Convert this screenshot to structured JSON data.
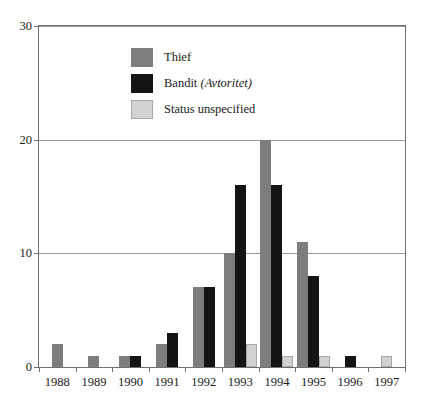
{
  "chart_data": {
    "type": "bar",
    "title": "",
    "xlabel": "",
    "ylabel": "",
    "ylim": [
      0,
      30
    ],
    "yticks": [
      0,
      10,
      20,
      30
    ],
    "grid": true,
    "legend_position": "top-left-inside",
    "categories": [
      "1988",
      "1989",
      "1990",
      "1991",
      "1992",
      "1993",
      "1994",
      "1995",
      "1996",
      "1997"
    ],
    "series": [
      {
        "name": "Thief",
        "color": "#7d7d7d",
        "values": [
          2,
          1,
          1,
          2,
          7,
          10,
          20,
          11,
          0,
          0
        ]
      },
      {
        "name": "Bandit",
        "name_alt": "(Avtoritet)",
        "color": "#141414",
        "values": [
          0,
          0,
          1,
          3,
          7,
          16,
          16,
          8,
          1,
          0
        ]
      },
      {
        "name": "Status unspecified",
        "color": "#d2d2d2",
        "values": [
          0,
          0,
          0,
          0,
          0,
          2,
          1,
          1,
          0,
          1
        ]
      }
    ]
  },
  "legend": {
    "items": [
      {
        "label": "Thief",
        "alt": "",
        "swatch": "thief"
      },
      {
        "label": "Bandit ",
        "alt": "(Avtoritet)",
        "swatch": "bandit"
      },
      {
        "label": "Status unspecified",
        "alt": "",
        "swatch": "unspecified"
      }
    ]
  }
}
